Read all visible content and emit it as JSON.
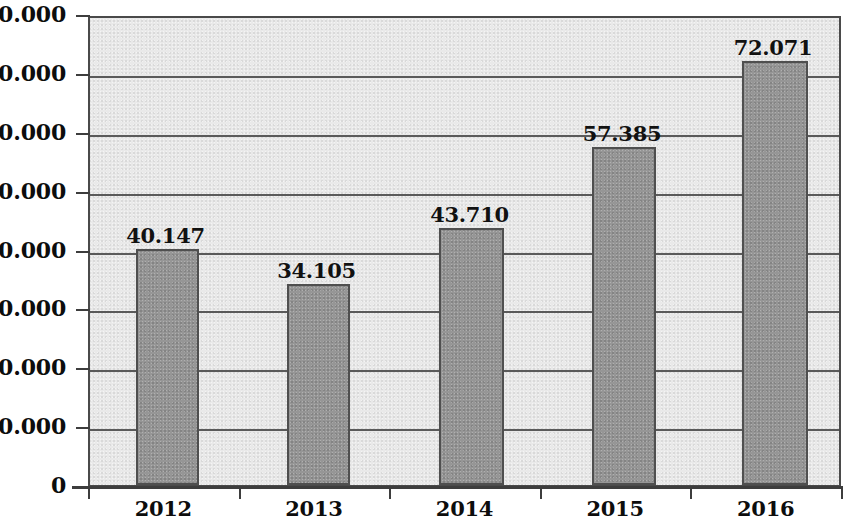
{
  "chart_data": {
    "type": "bar",
    "title": "",
    "subtitle": "",
    "xlabel": "",
    "ylabel": "",
    "categories": [
      "2012",
      "2013",
      "2014",
      "2015",
      "2016"
    ],
    "values": [
      40147,
      34105,
      43710,
      57385,
      72071
    ],
    "data_labels": [
      "40.147",
      "34.105",
      "43.710",
      "57.385",
      "72.071"
    ],
    "ylim": [
      0,
      80000
    ],
    "y_ticks": [
      0,
      10000,
      20000,
      30000,
      40000,
      50000,
      60000,
      70000,
      80000
    ],
    "y_tick_labels": [
      "0",
      "10.000",
      "20.000",
      "30.000",
      "40.000",
      "50.000",
      "60.000",
      "70.000",
      "80.000"
    ],
    "grid": true,
    "grid_axis": "y",
    "legend": false,
    "legend_position": "none",
    "series": [
      {
        "name": "",
        "values": [
          40147,
          34105,
          43710,
          57385,
          72071
        ]
      }
    ],
    "colors": {
      "bar_fill": "#969696",
      "bar_border": "#4f4f4f",
      "plot_background": "#e9e9e9",
      "gridline": "#5a5a5a",
      "axis": "#3d3d3d",
      "text": "#0d0d0d",
      "page_background": "#ffffff"
    }
  }
}
